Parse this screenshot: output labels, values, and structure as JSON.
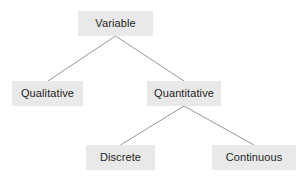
{
  "diagram": {
    "title": "Variable",
    "type": "tree-hierarchy",
    "background_color": "#ffffff",
    "node_fill_color": "#e9e9e9",
    "node_text_color": "#1f1f1f",
    "connector_color": "#8a8a8a",
    "nodes": [
      {
        "id": "variable",
        "label": "Variable",
        "level": 0
      },
      {
        "id": "qualitative",
        "label": "Qualitative",
        "level": 1
      },
      {
        "id": "quantitative",
        "label": "Quantitative",
        "level": 1
      },
      {
        "id": "discrete",
        "label": "Discrete",
        "level": 2
      },
      {
        "id": "continuous",
        "label": "Continuous",
        "level": 2
      }
    ],
    "edges": [
      {
        "from": "variable",
        "to": "qualitative"
      },
      {
        "from": "variable",
        "to": "quantitative"
      },
      {
        "from": "quantitative",
        "to": "discrete"
      },
      {
        "from": "quantitative",
        "to": "continuous"
      }
    ]
  }
}
